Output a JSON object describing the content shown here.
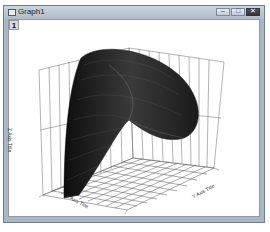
{
  "window": {
    "title": "Graph1",
    "controls": {
      "minimize": "–",
      "maximize": "□",
      "close": "✕"
    }
  },
  "layer": {
    "label": "1"
  },
  "graph": {
    "type": "3D surface",
    "axes": {
      "z_title": "Z Axis Title",
      "x_title": "X Axis Title",
      "y_title": "Y Axis Title"
    },
    "colors": {
      "surface": "#1a1a1a",
      "grid": "#555555"
    }
  }
}
